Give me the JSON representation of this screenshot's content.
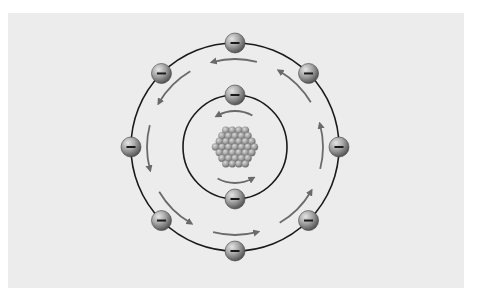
{
  "diagram": {
    "colors": {
      "panel": "#ececec",
      "orbit": "#1a1a1a",
      "arrow": "#6a6a6a",
      "electron_light": "#d6d6d6",
      "electron_mid": "#9a9a9a",
      "electron_dark": "#4a4a4a",
      "nucleon_light": "#d0d0d0",
      "nucleon_dark": "#6f6f6f"
    },
    "center": {
      "x": 235,
      "y": 147
    },
    "nucleus": {
      "label": "nucleus",
      "nucleon_count": 30
    },
    "orbits": [
      {
        "name": "inner-orbit",
        "radius": 52,
        "electron_count": 2,
        "electrons": [
          {
            "angle_deg": -90,
            "charge": "−",
            "arrow": "ccw"
          },
          {
            "angle_deg": 90,
            "charge": "−",
            "arrow": "ccw"
          }
        ]
      },
      {
        "name": "outer-orbit",
        "radius": 104,
        "electron_count": 8,
        "electrons": [
          {
            "angle_deg": -90,
            "charge": "−",
            "arrow": "ccw"
          },
          {
            "angle_deg": -135,
            "charge": "−",
            "arrow": "ccw"
          },
          {
            "angle_deg": 180,
            "charge": "−",
            "arrow": "ccw"
          },
          {
            "angle_deg": 135,
            "charge": "−",
            "arrow": "ccw"
          },
          {
            "angle_deg": 90,
            "charge": "−",
            "arrow": "ccw"
          },
          {
            "angle_deg": 45,
            "charge": "−",
            "arrow": "ccw"
          },
          {
            "angle_deg": 0,
            "charge": "−",
            "arrow": "ccw"
          },
          {
            "angle_deg": -45,
            "charge": "−",
            "arrow": "ccw"
          }
        ]
      }
    ],
    "electron_radius": 10
  }
}
